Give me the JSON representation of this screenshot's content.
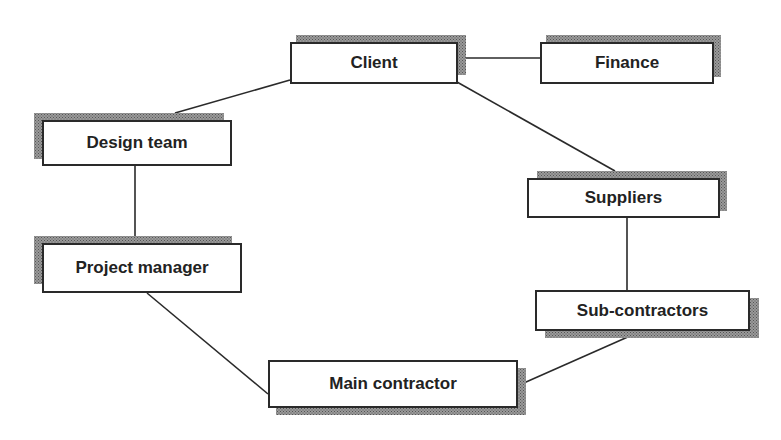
{
  "diagram": {
    "type": "organisational-relationship-network",
    "nodes": [
      {
        "id": "client",
        "label": "Client"
      },
      {
        "id": "finance",
        "label": "Finance"
      },
      {
        "id": "design_team",
        "label": "Design team"
      },
      {
        "id": "project_manager",
        "label": "Project manager"
      },
      {
        "id": "suppliers",
        "label": "Suppliers"
      },
      {
        "id": "sub_contractors",
        "label": "Sub-contractors"
      },
      {
        "id": "main_contractor",
        "label": "Main contractor"
      }
    ],
    "edges": [
      {
        "from": "client",
        "to": "finance"
      },
      {
        "from": "client",
        "to": "design_team"
      },
      {
        "from": "client",
        "to": "suppliers"
      },
      {
        "from": "design_team",
        "to": "project_manager"
      },
      {
        "from": "project_manager",
        "to": "main_contractor"
      },
      {
        "from": "main_contractor",
        "to": "sub_contractors"
      },
      {
        "from": "sub_contractors",
        "to": "suppliers"
      }
    ]
  },
  "colors": {
    "line": "#2a2a2a",
    "box_fill": "#ffffff",
    "shadow": "#9a9a9a",
    "text": "#222222"
  }
}
